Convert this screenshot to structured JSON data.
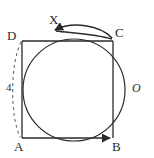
{
  "figure": {
    "type": "geometry-diagram",
    "stroke_color": "#2a2a2a",
    "background_color": "#ffffff",
    "faint_top_text": "",
    "labels": {
      "vertex_a": "A",
      "vertex_b": "B",
      "vertex_c": "C",
      "vertex_d": "D",
      "point_x": "X",
      "center_o": "O",
      "length_label": "4"
    },
    "square": {
      "name": "ABCD",
      "left": 22,
      "top": 41,
      "right": 113,
      "bottom": 138
    },
    "circle": {
      "center_x": 74,
      "center_y": 90,
      "radius": 51
    },
    "dashed_arc": {
      "from": "D",
      "to": "A",
      "label": "4"
    },
    "directed_path": {
      "segments": [
        "A to B",
        "B to C",
        "C to X"
      ],
      "arrow_heads": [
        "at B pointing right",
        "at X pointing left"
      ]
    }
  }
}
